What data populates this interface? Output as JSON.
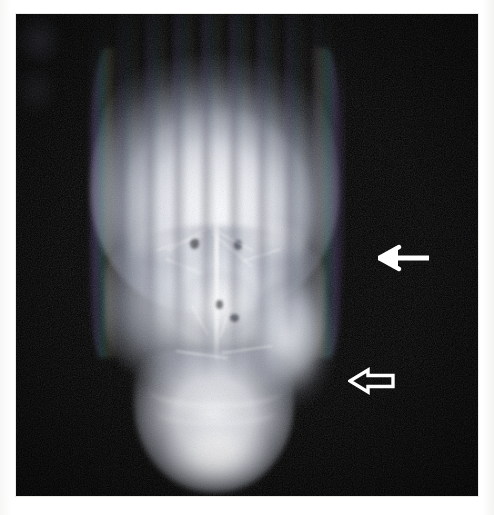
{
  "figure": {
    "modality": "skull-radiograph",
    "view": "anteroposterior",
    "caption": "",
    "panel": {
      "background_color": "#000000",
      "page_background_color": "#ffffff"
    }
  },
  "annotations": {
    "items": [
      {
        "id": "arrow-parietal",
        "name": "solid-arrow",
        "style": "solid",
        "direction": "left",
        "color": "#ffffff",
        "label": ""
      },
      {
        "id": "arrow-ramus",
        "name": "hollow-arrow",
        "style": "outline",
        "direction": "left",
        "color": "#ffffff",
        "label": ""
      }
    ]
  },
  "image_regions": {
    "cranial_vault": "cranial vault",
    "midface": "midface",
    "mandible": "mandible",
    "nasal_septum": "nasal septum",
    "orbit_left": "left orbit",
    "orbit_right": "right orbit",
    "sinus_cluster": "paranasal sinuses"
  },
  "artifacts": {
    "vertical_striping": "vertical banding artifact",
    "chromatic_fringing": "chromatic fringing"
  }
}
